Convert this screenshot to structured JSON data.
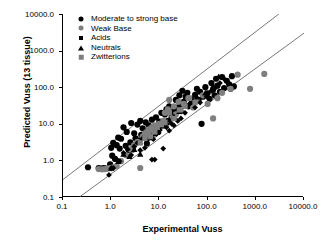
{
  "chart_data": {
    "type": "scatter",
    "title": "",
    "xlabel": "Experimental Vuss",
    "ylabel": "Predicted Vuss (13 tissue)",
    "xscale": "log",
    "yscale": "log",
    "xlim": [
      0.1,
      10000.0
    ],
    "ylim": [
      0.1,
      10000.0
    ],
    "grid": false,
    "legend_position": "top-left inside",
    "xticks": [
      "0.1",
      "1.0",
      "10.0",
      "100.0",
      "1000.0",
      "10000.0"
    ],
    "yticks": [
      "0.1",
      "1.0",
      "10.0",
      "100.0",
      "1000.0",
      "10000.0"
    ],
    "annotation_lines": [
      {
        "name": "upper-3fold-line",
        "from": [
          0.1,
          0.3
        ],
        "to": [
          3000.0,
          10000.0
        ],
        "style": "solid",
        "color": "#555555"
      },
      {
        "name": "lower-3fold-line",
        "from": [
          0.22,
          0.1
        ],
        "to": [
          10000.0,
          3000.0
        ],
        "style": "solid",
        "color": "#555555"
      }
    ],
    "series": [
      {
        "name": "Moderate to strong base",
        "marker": "circle",
        "color": "#000000",
        "points": [
          [
            0.33,
            0.65
          ],
          [
            0.55,
            0.62
          ],
          [
            0.62,
            0.6
          ],
          [
            0.7,
            0.62
          ],
          [
            0.78,
            0.6
          ],
          [
            0.95,
            0.78
          ],
          [
            1.0,
            2.2
          ],
          [
            1.05,
            1.35
          ],
          [
            1.1,
            3.0
          ],
          [
            1.2,
            1.1
          ],
          [
            1.3,
            2.6
          ],
          [
            1.4,
            4.2
          ],
          [
            1.5,
            2.1
          ],
          [
            1.6,
            3.9
          ],
          [
            1.8,
            8.0
          ],
          [
            2.0,
            2.5
          ],
          [
            2.1,
            6.0
          ],
          [
            2.3,
            1.9
          ],
          [
            2.5,
            3.1
          ],
          [
            2.6,
            10.5
          ],
          [
            2.8,
            2.0
          ],
          [
            3.0,
            5.5
          ],
          [
            3.2,
            4.0
          ],
          [
            3.5,
            9.5
          ],
          [
            3.8,
            3.5
          ],
          [
            4.0,
            12.0
          ],
          [
            4.2,
            5.0
          ],
          [
            4.5,
            7.5
          ],
          [
            5.0,
            4.3
          ],
          [
            5.2,
            11.0
          ],
          [
            5.5,
            2.9
          ],
          [
            5.8,
            6.5
          ],
          [
            6.0,
            9.0
          ],
          [
            6.5,
            4.8
          ],
          [
            7.0,
            13.0
          ],
          [
            7.5,
            7.0
          ],
          [
            8.0,
            5.2
          ],
          [
            8.5,
            15.0
          ],
          [
            9.0,
            8.5
          ],
          [
            9.5,
            6.0
          ],
          [
            10.0,
            11.5
          ],
          [
            11.0,
            20.0
          ],
          [
            12.0,
            9.0
          ],
          [
            13.0,
            18.0
          ],
          [
            14.0,
            25.0
          ],
          [
            15.0,
            12.0
          ],
          [
            16.0,
            30.0
          ],
          [
            18.0,
            16.0
          ],
          [
            20.0,
            22.0
          ],
          [
            22.0,
            45.0
          ],
          [
            24.0,
            28.0
          ],
          [
            26.0,
            60.0
          ],
          [
            28.0,
            35.0
          ],
          [
            30.0,
            80.0
          ],
          [
            32.0,
            40.0
          ],
          [
            35.0,
            55.0
          ],
          [
            38.0,
            70.0
          ],
          [
            40.0,
            30.0
          ],
          [
            45.0,
            48.0
          ],
          [
            50.0,
            38.0
          ],
          [
            55.0,
            62.0
          ],
          [
            60.0,
            90.0
          ],
          [
            65.0,
            45.0
          ],
          [
            70.0,
            75.0
          ],
          [
            75.0,
            10.0
          ],
          [
            80.0,
            55.0
          ],
          [
            90.0,
            100.0
          ],
          [
            100.0,
            68.0
          ],
          [
            110.0,
            48.0
          ],
          [
            120.0,
            130.0
          ],
          [
            130.0,
            85.0
          ],
          [
            140.0,
            60.0
          ],
          [
            150.0,
            170.0
          ],
          [
            160.0,
            110.0
          ],
          [
            180.0,
            75.0
          ],
          [
            200.0,
            190.0
          ],
          [
            220.0,
            95.0
          ],
          [
            250.0,
            150.0
          ],
          [
            280.0,
            120.0
          ],
          [
            300.0,
            90.0
          ],
          [
            320.0,
            200.0
          ],
          [
            350.0,
            105.0
          ]
        ]
      },
      {
        "name": "Weak Base",
        "marker": "circle",
        "color": "#7f7f7f",
        "points": [
          [
            0.55,
            0.58
          ],
          [
            0.65,
            0.57
          ],
          [
            0.75,
            0.58
          ],
          [
            0.85,
            0.6
          ],
          [
            0.95,
            0.62
          ],
          [
            1.1,
            0.65
          ],
          [
            1.3,
            0.7
          ],
          [
            1.6,
            0.95
          ],
          [
            2.0,
            1.4
          ],
          [
            2.5,
            2.0
          ],
          [
            3.0,
            2.6
          ],
          [
            3.5,
            3.2
          ],
          [
            4.0,
            0.62
          ],
          [
            4.5,
            4.5
          ],
          [
            5.0,
            5.5
          ],
          [
            5.5,
            6.0
          ],
          [
            6.0,
            7.0
          ],
          [
            6.5,
            6.5
          ],
          [
            7.0,
            8.0
          ],
          [
            7.5,
            5.0
          ],
          [
            8.0,
            9.0
          ],
          [
            9.0,
            7.5
          ],
          [
            10.0,
            10.0
          ],
          [
            11.0,
            8.5
          ],
          [
            12.0,
            12.0
          ],
          [
            13.0,
            20.0
          ],
          [
            14.0,
            9.5
          ],
          [
            15.0,
            25.0
          ],
          [
            16.0,
            45.0
          ],
          [
            18.0,
            14.0
          ],
          [
            20.0,
            30.0
          ],
          [
            22.0,
            18.0
          ],
          [
            25.0,
            40.0
          ],
          [
            28.0,
            22.0
          ],
          [
            32.0,
            35.0
          ],
          [
            40.0,
            50.0
          ],
          [
            50.0,
            28.0
          ],
          [
            60.0,
            42.0
          ],
          [
            80.0,
            60.0
          ],
          [
            100.0,
            35.0
          ],
          [
            130.0,
            14.0
          ],
          [
            160.0,
            50.0
          ],
          [
            200.0,
            70.0
          ],
          [
            300.0,
            90.0
          ],
          [
            420.0,
            220.0
          ],
          [
            760.0,
            90.0
          ],
          [
            1500.0,
            230.0
          ]
        ]
      },
      {
        "name": "Acids",
        "marker": "diamond",
        "color": "#000000",
        "points": [
          [
            0.9,
            0.4
          ],
          [
            1.0,
            0.6
          ],
          [
            1.1,
            0.62
          ],
          [
            1.3,
            1.05
          ],
          [
            1.5,
            0.95
          ],
          [
            1.8,
            1.6
          ],
          [
            2.2,
            2.0
          ],
          [
            2.6,
            1.4
          ],
          [
            3.0,
            2.4
          ],
          [
            3.5,
            3.0
          ],
          [
            4.0,
            1.9
          ],
          [
            4.5,
            4.0
          ],
          [
            5.0,
            2.2
          ],
          [
            5.5,
            3.5
          ],
          [
            6.0,
            4.5
          ],
          [
            6.5,
            5.0
          ],
          [
            7.0,
            1.05
          ],
          [
            7.5,
            3.8
          ],
          [
            8.0,
            1.05
          ],
          [
            8.5,
            6.0
          ],
          [
            9.0,
            5.5
          ],
          [
            10.0,
            7.0
          ],
          [
            12.0,
            2.1
          ],
          [
            14.0,
            8.0
          ],
          [
            16.0,
            6.5
          ],
          [
            18.0,
            10.0
          ],
          [
            20.0,
            9.0
          ],
          [
            24.0,
            12.0
          ],
          [
            28.0,
            14.0
          ],
          [
            34.0,
            20.0
          ],
          [
            42.0,
            35.0
          ],
          [
            55.0,
            28.0
          ],
          [
            70.0,
            38.0
          ],
          [
            95.0,
            55.0
          ],
          [
            120.0,
            80.0
          ],
          [
            150.0,
            100.0
          ],
          [
            180.0,
            130.0
          ],
          [
            230.0,
            160.0
          ]
        ]
      },
      {
        "name": "Neutrals",
        "marker": "triangle",
        "color": "#000000",
        "points": [
          [
            1.0,
            0.62
          ],
          [
            1.4,
            0.95
          ],
          [
            1.8,
            1.5
          ],
          [
            2.4,
            1.3
          ],
          [
            3.0,
            2.0
          ],
          [
            4.0,
            1.5
          ],
          [
            5.0,
            4.0
          ],
          [
            6.0,
            4.8
          ],
          [
            7.0,
            4.2
          ],
          [
            8.0,
            5.5
          ],
          [
            9.0,
            6.2
          ],
          [
            10.0,
            7.5
          ],
          [
            12.0,
            9.0
          ],
          [
            14.0,
            11.0
          ],
          [
            16.0,
            13.0
          ],
          [
            20.0,
            16.0
          ],
          [
            26.0,
            22.0
          ],
          [
            34.0,
            30.0
          ],
          [
            45.0,
            40.0
          ],
          [
            60.0,
            55.0
          ],
          [
            90.0,
            70.0
          ],
          [
            130.0,
            110.0
          ],
          [
            170.0,
            195.0
          ]
        ]
      },
      {
        "name": "Zwitterions",
        "marker": "square",
        "color": "#7f7f7f",
        "points": [
          [
            4.0,
            3.0
          ],
          [
            5.0,
            4.0
          ],
          [
            5.5,
            5.0
          ],
          [
            6.0,
            6.0
          ],
          [
            6.5,
            4.5
          ],
          [
            7.0,
            7.0
          ],
          [
            8.0,
            6.0
          ],
          [
            9.0,
            8.0
          ],
          [
            11.0,
            9.5
          ],
          [
            13.0,
            11.0
          ],
          [
            16.0,
            20.0
          ],
          [
            20.0,
            14.0
          ],
          [
            26.0,
            24.0
          ],
          [
            34.0,
            30.0
          ],
          [
            42.0,
            50.0
          ],
          [
            55.0,
            38.0
          ]
        ]
      }
    ]
  },
  "legend": {
    "items": [
      {
        "label": "Moderate to strong base",
        "marker": "circle-black"
      },
      {
        "label": "Weak Base",
        "marker": "circle-gray"
      },
      {
        "label": "Acids",
        "marker": "diamond-black"
      },
      {
        "label": "Neutrals",
        "marker": "triangle-black"
      },
      {
        "label": "Zwitterions",
        "marker": "square-gray"
      }
    ]
  },
  "axes": {
    "x": {
      "label": "Experimental Vuss",
      "ticks": [
        "0.1",
        "1.0",
        "10.0",
        "100.0",
        "1000.0",
        "10000.0"
      ]
    },
    "y": {
      "label": "Predicted Vuss (13 tissue)",
      "ticks": [
        "10000.0",
        "1000.0",
        "100.0",
        "10.0",
        "1.0",
        "0.1"
      ]
    }
  }
}
